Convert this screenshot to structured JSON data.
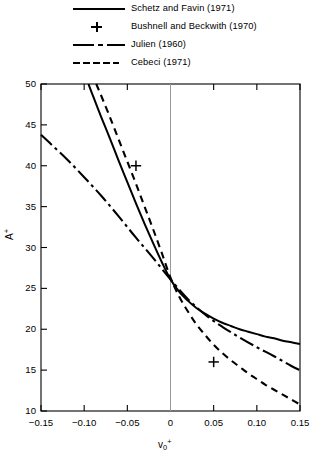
{
  "legend": {
    "entries": [
      {
        "label": "Schetz and Favin (1971)",
        "style": "solid",
        "name": "legend-schetz-favin"
      },
      {
        "label": "Bushnell and Beckwith (1970)",
        "style": "plus",
        "name": "legend-bushnell-beckwith"
      },
      {
        "label": "Julien (1960)",
        "style": "dashdot",
        "name": "legend-julien"
      },
      {
        "label": "Cebeci (1971)",
        "style": "dashed",
        "name": "legend-cebeci"
      }
    ]
  },
  "axes": {
    "y_ticks": [
      "50",
      "45",
      "40",
      "35",
      "30",
      "25",
      "20",
      "15",
      "10"
    ],
    "x_ticks": [
      "−0.15",
      "−0.10",
      "−0.05",
      "0",
      "0.05",
      "0.10",
      "0.15"
    ],
    "ylabel_main": "A",
    "ylabel_sup": "+",
    "xlabel_main": "v",
    "xlabel_sub": "0",
    "xlabel_sup": "+"
  },
  "chart_data": {
    "type": "line",
    "title": "",
    "xlabel": "v0+",
    "ylabel": "A+",
    "xlim": [
      -0.15,
      0.15
    ],
    "ylim": [
      10,
      50
    ],
    "xticks": [
      -0.15,
      -0.1,
      -0.05,
      0,
      0.05,
      0.1,
      0.15
    ],
    "yticks": [
      10,
      15,
      20,
      25,
      30,
      35,
      40,
      45,
      50
    ],
    "grid": false,
    "legend_position": "above-plot",
    "series": [
      {
        "name": "Schetz and Favin (1971)",
        "style": "solid",
        "x": [
          -0.095,
          -0.09,
          -0.08,
          -0.07,
          -0.06,
          -0.05,
          -0.04,
          -0.03,
          -0.02,
          -0.01,
          0.0,
          0.01,
          0.02,
          0.03,
          0.04,
          0.05,
          0.06,
          0.07,
          0.08,
          0.09,
          0.1,
          0.11,
          0.12,
          0.13,
          0.14,
          0.15
        ],
        "y": [
          50.0,
          48.6,
          45.9,
          43.3,
          40.6,
          38.0,
          35.4,
          32.9,
          30.5,
          28.2,
          26.1,
          24.6,
          23.5,
          22.6,
          21.9,
          21.3,
          20.8,
          20.4,
          20.0,
          19.7,
          19.4,
          19.1,
          18.9,
          18.6,
          18.4,
          18.2
        ]
      },
      {
        "name": "Bushnell and Beckwith (1970)",
        "style": "plus-markers",
        "x": [
          -0.04,
          0.05
        ],
        "y": [
          40.0,
          16.0
        ]
      },
      {
        "name": "Julien (1960)",
        "style": "dashdot",
        "x": [
          -0.15,
          -0.14,
          -0.12,
          -0.1,
          -0.08,
          -0.06,
          -0.04,
          -0.02,
          0.0,
          0.02,
          0.04,
          0.06,
          0.08,
          0.1,
          0.12,
          0.14,
          0.15
        ],
        "y": [
          43.8,
          42.8,
          40.8,
          38.6,
          36.3,
          33.8,
          31.2,
          28.7,
          26.1,
          23.7,
          21.8,
          20.3,
          19.0,
          17.8,
          16.7,
          15.5,
          15.0
        ]
      },
      {
        "name": "Cebeci (1971)",
        "style": "dashed",
        "x": [
          -0.086,
          -0.08,
          -0.07,
          -0.06,
          -0.05,
          -0.04,
          -0.03,
          -0.02,
          -0.01,
          0.0,
          0.01,
          0.02,
          0.03,
          0.04,
          0.05,
          0.06,
          0.07,
          0.08,
          0.09,
          0.1,
          0.11,
          0.12,
          0.13,
          0.14,
          0.15
        ],
        "y": [
          50.0,
          48.5,
          45.9,
          43.2,
          40.5,
          37.8,
          35.0,
          32.2,
          29.3,
          26.3,
          24.0,
          22.2,
          20.6,
          19.3,
          18.1,
          17.1,
          16.2,
          15.4,
          14.6,
          13.9,
          13.2,
          12.6,
          12.0,
          11.4,
          10.8
        ]
      }
    ]
  }
}
